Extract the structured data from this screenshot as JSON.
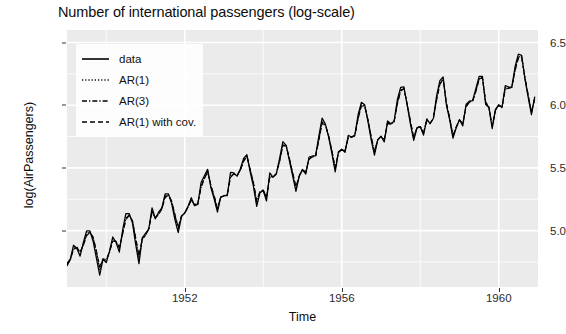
{
  "chart_data": {
    "type": "line",
    "title": "Number of international passengers (log-scale)",
    "xlabel": "Time",
    "ylabel": "log(AirPassengers)",
    "xlim": [
      1949.0,
      1961.0
    ],
    "ylim": [
      4.55,
      6.6
    ],
    "xticks": [
      1952,
      1956,
      1960
    ],
    "xtick_labels": [
      "1952",
      "1956",
      "1960"
    ],
    "yticks": [
      5.0,
      5.5,
      6.0,
      6.5
    ],
    "ytick_labels": [
      "5.0",
      "5.5",
      "6.0",
      "6.5"
    ],
    "minor_yticks": [
      4.75,
      5.25,
      5.75,
      6.25
    ],
    "minor_xticks": [
      1950,
      1954,
      1958
    ],
    "grid": true,
    "legend_position": "top-left",
    "panel_background": "#ebebeb",
    "grid_color": "#ffffff",
    "line_color": "#000000",
    "x_start": 1949.0,
    "x_step": 0.0833333,
    "series": [
      {
        "name": "data",
        "dash": "solid",
        "values": [
          4.718,
          4.771,
          4.883,
          4.86,
          4.796,
          4.905,
          4.997,
          4.997,
          4.913,
          4.779,
          4.644,
          4.771,
          4.745,
          4.836,
          4.949,
          4.905,
          4.828,
          5.004,
          5.136,
          5.136,
          5.063,
          4.89,
          4.736,
          4.942,
          4.977,
          5.011,
          5.182,
          5.094,
          5.147,
          5.182,
          5.293,
          5.293,
          5.215,
          5.088,
          4.984,
          5.112,
          5.142,
          5.193,
          5.263,
          5.198,
          5.209,
          5.384,
          5.438,
          5.489,
          5.342,
          5.252,
          5.147,
          5.268,
          5.278,
          5.278,
          5.464,
          5.46,
          5.434,
          5.493,
          5.576,
          5.606,
          5.468,
          5.352,
          5.193,
          5.303,
          5.318,
          5.236,
          5.46,
          5.425,
          5.455,
          5.576,
          5.71,
          5.68,
          5.557,
          5.434,
          5.313,
          5.434,
          5.489,
          5.451,
          5.587,
          5.595,
          5.598,
          5.753,
          5.897,
          5.849,
          5.743,
          5.613,
          5.468,
          5.628,
          5.649,
          5.624,
          5.759,
          5.746,
          5.762,
          5.924,
          6.023,
          6.004,
          5.872,
          5.724,
          5.602,
          5.724,
          5.753,
          5.707,
          5.875,
          5.852,
          5.872,
          6.045,
          6.142,
          6.146,
          6.001,
          5.849,
          5.72,
          5.817,
          5.829,
          5.762,
          5.892,
          5.852,
          5.894,
          6.075,
          6.196,
          6.225,
          6.001,
          5.883,
          5.737,
          5.82,
          5.886,
          5.835,
          6.006,
          6.033,
          6.037,
          6.133,
          6.23,
          6.23,
          6.006,
          5.981,
          5.814,
          5.966,
          6.004,
          5.981,
          6.157,
          6.145,
          6.147,
          6.309,
          6.407,
          6.398,
          6.211,
          6.063,
          5.924,
          6.068
        ]
      },
      {
        "name": "AR(1)",
        "dash": "dotted",
        "values": [
          4.728,
          4.76,
          4.862,
          4.872,
          4.818,
          4.888,
          4.973,
          4.994,
          4.937,
          4.816,
          4.682,
          4.768,
          4.757,
          4.824,
          4.928,
          4.912,
          4.851,
          4.979,
          5.104,
          5.128,
          5.075,
          4.925,
          4.773,
          4.93,
          4.965,
          5.012,
          5.158,
          5.1,
          5.134,
          5.177,
          5.276,
          5.29,
          5.228,
          5.114,
          5.008,
          5.114,
          5.14,
          5.188,
          5.248,
          5.203,
          5.212,
          5.358,
          5.424,
          5.477,
          5.354,
          5.267,
          5.164,
          5.266,
          5.277,
          5.286,
          5.44,
          5.454,
          5.436,
          5.486,
          5.563,
          5.599,
          5.482,
          5.372,
          5.218,
          5.31,
          5.321,
          5.26,
          5.438,
          5.428,
          5.453,
          5.56,
          5.69,
          5.679,
          5.568,
          5.451,
          5.333,
          5.435,
          5.484,
          5.462,
          5.576,
          5.589,
          5.594,
          5.732,
          5.872,
          5.845,
          5.752,
          5.628,
          5.487,
          5.625,
          5.646,
          5.633,
          5.748,
          5.744,
          5.758,
          5.903,
          6.004,
          5.999,
          5.881,
          5.74,
          5.619,
          5.724,
          5.751,
          5.72,
          5.861,
          5.85,
          5.868,
          6.022,
          6.123,
          6.137,
          6.007,
          5.864,
          5.735,
          5.82,
          5.829,
          5.777,
          5.885,
          5.855,
          5.892,
          6.053,
          6.177,
          6.212,
          6.011,
          5.893,
          5.751,
          5.824,
          5.884,
          5.848,
          5.996,
          6.027,
          6.034,
          6.117,
          6.214,
          6.223,
          6.019,
          5.983,
          5.827,
          5.963,
          6.0,
          5.984,
          6.14,
          6.139,
          6.143,
          6.288,
          6.388,
          6.388,
          6.216,
          6.077,
          5.938,
          6.059
        ]
      },
      {
        "name": "AR(3)",
        "dash": "dashdot",
        "values": [
          4.733,
          4.766,
          4.855,
          4.868,
          4.826,
          4.884,
          4.966,
          4.99,
          4.942,
          4.827,
          4.697,
          4.772,
          4.762,
          4.829,
          4.922,
          4.913,
          4.859,
          4.975,
          5.096,
          5.124,
          5.078,
          4.935,
          4.786,
          4.932,
          4.963,
          5.014,
          5.15,
          5.101,
          5.131,
          5.175,
          5.269,
          5.287,
          5.232,
          5.122,
          5.017,
          5.116,
          5.139,
          5.188,
          5.244,
          5.205,
          5.214,
          5.351,
          5.418,
          5.472,
          5.357,
          5.273,
          5.172,
          5.266,
          5.277,
          5.289,
          5.432,
          5.452,
          5.437,
          5.484,
          5.557,
          5.596,
          5.486,
          5.378,
          5.228,
          5.312,
          5.322,
          5.266,
          5.431,
          5.429,
          5.452,
          5.555,
          5.683,
          5.678,
          5.572,
          5.457,
          5.341,
          5.436,
          5.483,
          5.466,
          5.572,
          5.588,
          5.593,
          5.726,
          5.864,
          5.843,
          5.755,
          5.633,
          5.494,
          5.624,
          5.645,
          5.636,
          5.744,
          5.744,
          5.757,
          5.897,
          5.998,
          5.997,
          5.884,
          5.746,
          5.625,
          5.724,
          5.75,
          5.724,
          5.856,
          5.85,
          5.867,
          6.015,
          6.117,
          6.134,
          6.009,
          5.869,
          5.74,
          5.821,
          5.829,
          5.781,
          5.881,
          5.856,
          5.892,
          6.046,
          6.171,
          6.208,
          6.014,
          5.896,
          5.755,
          5.825,
          5.883,
          5.851,
          5.991,
          6.025,
          6.033,
          6.112,
          6.209,
          6.221,
          6.023,
          5.984,
          5.831,
          5.962,
          5.999,
          5.985,
          6.134,
          6.137,
          6.142,
          6.281,
          6.382,
          6.385,
          6.218,
          6.08,
          5.942,
          6.056
        ]
      },
      {
        "name": "AR(1) with cov.",
        "dash": "dashed",
        "values": [
          4.74,
          4.772,
          4.848,
          4.862,
          4.833,
          4.88,
          4.958,
          4.985,
          4.948,
          4.838,
          4.712,
          4.776,
          4.768,
          4.834,
          4.915,
          4.915,
          4.867,
          4.97,
          5.087,
          5.119,
          5.082,
          4.945,
          4.799,
          4.935,
          4.96,
          5.016,
          5.142,
          5.103,
          5.128,
          5.172,
          5.261,
          5.284,
          5.236,
          5.13,
          5.026,
          5.118,
          5.138,
          5.188,
          5.24,
          5.207,
          5.216,
          5.344,
          5.412,
          5.467,
          5.36,
          5.279,
          5.18,
          5.266,
          5.277,
          5.292,
          5.424,
          5.45,
          5.438,
          5.482,
          5.551,
          5.593,
          5.49,
          5.384,
          5.238,
          5.314,
          5.323,
          5.272,
          5.424,
          5.43,
          5.451,
          5.55,
          5.676,
          5.677,
          5.576,
          5.463,
          5.349,
          5.437,
          5.482,
          5.47,
          5.568,
          5.587,
          5.592,
          5.72,
          5.856,
          5.841,
          5.758,
          5.638,
          5.501,
          5.623,
          5.644,
          5.639,
          5.74,
          5.744,
          5.756,
          5.891,
          5.992,
          5.995,
          5.887,
          5.752,
          5.631,
          5.724,
          5.749,
          5.728,
          5.851,
          5.85,
          5.866,
          6.008,
          6.111,
          6.131,
          6.011,
          5.874,
          5.745,
          5.822,
          5.829,
          5.785,
          5.877,
          5.857,
          5.892,
          6.039,
          6.165,
          6.204,
          6.017,
          5.899,
          5.759,
          5.826,
          5.882,
          5.854,
          5.986,
          6.023,
          6.032,
          6.107,
          6.204,
          6.219,
          6.027,
          5.985,
          5.835,
          5.961,
          5.998,
          5.986,
          6.128,
          6.135,
          6.141,
          6.274,
          6.376,
          6.382,
          6.22,
          6.083,
          5.946,
          6.053
        ]
      }
    ]
  },
  "legend": {
    "items": [
      {
        "label": "data",
        "dash": "solid"
      },
      {
        "label": "AR(1)",
        "dash": "dotted"
      },
      {
        "label": "AR(3)",
        "dash": "dashdot"
      },
      {
        "label": "AR(1) with cov.",
        "dash": "dashed"
      }
    ]
  }
}
